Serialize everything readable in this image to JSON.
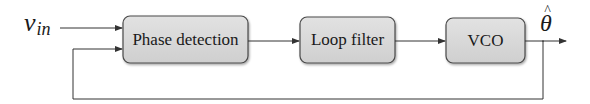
{
  "diagram": {
    "type": "block-diagram",
    "input": {
      "symbol": "v",
      "subscript": "in"
    },
    "output": {
      "symbol": "θ",
      "accent": "^"
    },
    "blocks": [
      {
        "id": "pd",
        "label": "Phase detection"
      },
      {
        "id": "lf",
        "label": "Loop filter"
      },
      {
        "id": "vco",
        "label": "VCO"
      }
    ],
    "connections": [
      {
        "from": "input",
        "to": "pd"
      },
      {
        "from": "pd",
        "to": "lf"
      },
      {
        "from": "lf",
        "to": "vco"
      },
      {
        "from": "vco",
        "to": "output"
      },
      {
        "from": "output",
        "to": "pd",
        "kind": "feedback"
      }
    ],
    "colors": {
      "block_fill": "#d6d6d6",
      "block_stroke": "#4a4a4a",
      "line": "#333333"
    }
  }
}
